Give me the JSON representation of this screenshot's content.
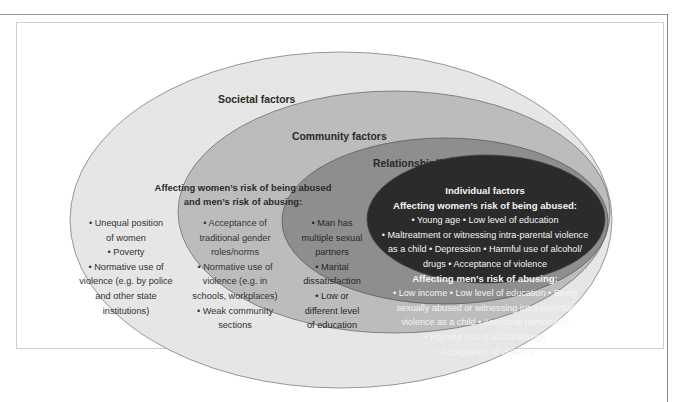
{
  "diagram": {
    "type": "nested-ellipses",
    "colors": {
      "societal_fill": "#e6e6e6",
      "community_fill": "#bdbdbd",
      "relationship_fill": "#8f8f8f",
      "individual_fill": "#2b2b2b",
      "outline": "#7a7a7a"
    },
    "layers": {
      "societal": {
        "title": "Societal factors",
        "items": [
          "• Unequal position",
          "of women",
          "• Poverty",
          "• Normative use of",
          "violence (e.g. by police",
          "and other state",
          "institutions)"
        ]
      },
      "shared_heading": {
        "line1": "Affecting women’s risk of being abused",
        "line2": "and men’s risk of abusing:"
      },
      "community": {
        "title": "Community factors",
        "items": [
          "• Acceptance of",
          "traditional gender",
          "roles/norms",
          "• Normative use of",
          "violence (e.g. in",
          "schools, workplaces)",
          "• Weak community",
          "sections"
        ]
      },
      "relationship": {
        "title": "Relationship/family factors",
        "items": [
          "• Man has",
          "multiple sexual",
          "partners",
          "• Marital",
          "dissatisfaction",
          "• Low or",
          "different level",
          "of education"
        ]
      },
      "individual": {
        "title": "Individual factors",
        "women_heading": "Affecting women’s risk of being abused:",
        "women_items": [
          "• Young age  • Low level of education",
          "• Maltreatment or witnessing intra-parental violence",
          "as a child  • Depression  • Harmful use of alcohol/",
          "drugs  • Acceptance of violence"
        ],
        "men_heading": "Affecting men’s risk of abusing:",
        "men_items": [
          "• Low income  • Low level of education  • Being",
          "sexually abused or witnessing intra-parental",
          "violence as a child  • Antisocial personality",
          "• Harmful use of alcohol/drugs",
          "• Acceptance of violence"
        ]
      }
    }
  }
}
